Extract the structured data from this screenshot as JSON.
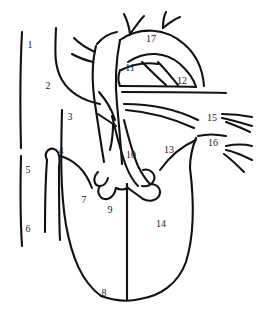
{
  "figure": {
    "type": "anatomical-line-drawing",
    "background_color": "#ffffff",
    "line_color": "#111111",
    "label_color": "#1a1a1a",
    "width": 256,
    "height": 332
  },
  "labels": [
    {
      "id": "label-1",
      "text": "1",
      "x": 30,
      "y": 45
    },
    {
      "id": "label-2",
      "text": "2",
      "x": 48,
      "y": 86
    },
    {
      "id": "label-3",
      "text": "3",
      "x": 70,
      "y": 117
    },
    {
      "id": "label-4",
      "text": "4",
      "x": 61,
      "y": 151
    },
    {
      "id": "label-5",
      "text": "5",
      "x": 28,
      "y": 170
    },
    {
      "id": "label-6",
      "text": "6",
      "x": 28,
      "y": 229
    },
    {
      "id": "label-7",
      "text": "7",
      "x": 84,
      "y": 200
    },
    {
      "id": "label-8",
      "text": "8",
      "x": 104,
      "y": 293
    },
    {
      "id": "label-9",
      "text": "9",
      "x": 110,
      "y": 210
    },
    {
      "id": "label-10",
      "text": "10",
      "x": 131,
      "y": 155
    },
    {
      "id": "label-11",
      "text": "11",
      "x": 130,
      "y": 68
    },
    {
      "id": "label-12",
      "text": "12",
      "x": 182,
      "y": 81
    },
    {
      "id": "label-13",
      "text": "13",
      "x": 169,
      "y": 150
    },
    {
      "id": "label-14",
      "text": "14",
      "x": 161,
      "y": 224
    },
    {
      "id": "label-15",
      "text": "15",
      "x": 212,
      "y": 118
    },
    {
      "id": "label-16",
      "text": "16",
      "x": 213,
      "y": 143
    },
    {
      "id": "label-17",
      "text": "17",
      "x": 151,
      "y": 39
    }
  ]
}
